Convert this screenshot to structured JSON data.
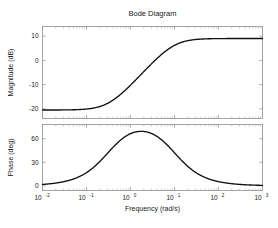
{
  "figure": {
    "title": "Bode Diagram",
    "background_color": "#ffffff",
    "curve_color": "#111111",
    "axis_color": "#9a9a9a",
    "width": 278,
    "height": 228
  },
  "xaxis": {
    "label": "Frequency  (rad/s)",
    "scale": "log",
    "unit": "rad/s",
    "min": 0.01,
    "max": 1000,
    "tick_values": [
      0.01,
      0.1,
      1,
      10,
      100,
      1000
    ],
    "tick_labels": [
      {
        "base": "10",
        "exp": "-2"
      },
      {
        "base": "10",
        "exp": "-1"
      },
      {
        "base": "10",
        "exp": "0"
      },
      {
        "base": "10",
        "exp": "1"
      },
      {
        "base": "10",
        "exp": "2"
      },
      {
        "base": "10",
        "exp": "3"
      }
    ]
  },
  "magnitude_axis": {
    "label": "Magnitude (dB)",
    "unit": "dB",
    "min": -24,
    "max": 14,
    "tick_values": [
      10,
      0,
      -10,
      -20
    ],
    "tick_labels": [
      "10",
      "0",
      "-10",
      "-20"
    ]
  },
  "phase_axis": {
    "label": "Phase (deg)",
    "unit": "deg",
    "min": -6,
    "max": 78,
    "tick_values": [
      60,
      30,
      0
    ],
    "tick_labels": [
      "60",
      "30",
      "0"
    ]
  },
  "chart_data": {
    "type": "line",
    "title": "Bode Diagram",
    "xlabel": "Frequency  (rad/s)",
    "xscale": "log",
    "xlim": [
      0.01,
      1000
    ],
    "grid": false,
    "legend": "none",
    "system": {
      "description": "lead compensator",
      "zero_rad_s": 0.32,
      "pole_rad_s": 9.6,
      "dc_gain_db": -20.5,
      "hf_gain_db": 9.0,
      "center_frequency_rad_s": 1.75,
      "max_phase_deg": 68
    },
    "subplots": [
      {
        "name": "magnitude",
        "ylabel": "Magnitude (dB)",
        "ylim": [
          -24,
          14
        ],
        "yticks": [
          10,
          0,
          -10,
          -20
        ],
        "x": [
          0.01,
          0.0178,
          0.0316,
          0.0562,
          0.1,
          0.178,
          0.316,
          0.562,
          1.0,
          1.78,
          3.16,
          5.62,
          10.0,
          17.8,
          31.6,
          56.2,
          100.0,
          178.0,
          316.0,
          562.0,
          1000.0
        ],
        "y": [
          -20.5,
          -20.5,
          -20.4,
          -20.3,
          -20.1,
          -19.6,
          -18.5,
          -16.4,
          -13.1,
          -8.9,
          -4.6,
          -0.8,
          2.3,
          4.9,
          6.9,
          8.1,
          8.7,
          8.9,
          9.0,
          9.0,
          9.0
        ]
      },
      {
        "name": "phase",
        "ylabel": "Phase (deg)",
        "ylim": [
          -6,
          78
        ],
        "yticks": [
          60,
          30,
          0
        ],
        "x": [
          0.01,
          0.0178,
          0.0316,
          0.0562,
          0.1,
          0.178,
          0.316,
          0.562,
          1.0,
          1.78,
          3.16,
          5.62,
          10.0,
          17.8,
          31.6,
          56.2,
          100.0,
          178.0,
          316.0,
          562.0,
          1000.0
        ],
        "y": [
          1.7,
          3.1,
          5.5,
          9.6,
          16.3,
          26.3,
          39.0,
          53.6,
          65.0,
          68.0,
          62.2,
          49.8,
          35.2,
          22.4,
          13.3,
          7.6,
          4.3,
          2.4,
          1.4,
          0.8,
          0.4
        ]
      }
    ]
  }
}
